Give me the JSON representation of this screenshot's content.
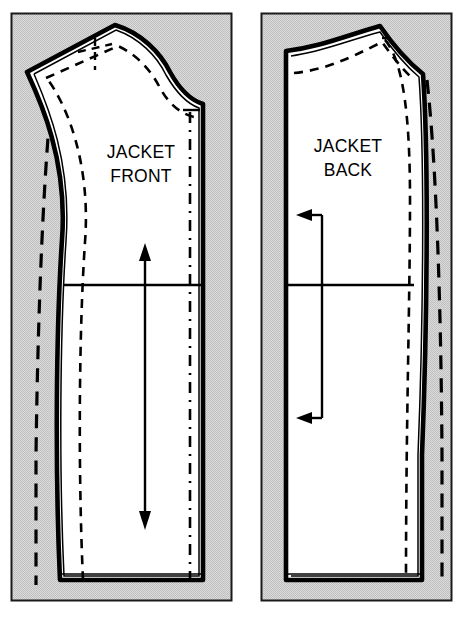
{
  "document": {
    "type": "sewing-pattern-diagram",
    "title": "Jacket pattern pieces",
    "background_color": "#ffffff"
  },
  "colors": {
    "fabric_fill": "#d9d9d9",
    "pattern_fill": "#ffffff",
    "ink": "#000000",
    "frame": "#1a1a1a"
  },
  "panels": [
    {
      "id": "front",
      "label_line1": "JACKET",
      "label_line2": "FRONT",
      "label_x": 141,
      "label_y": 158,
      "fabric_rect": {
        "x": 11,
        "y": 13,
        "width": 221,
        "height": 588
      },
      "grainline": {
        "style": "double-headed-arrow",
        "x": 145,
        "y_top": 250,
        "y_bottom": 524
      },
      "markings": [
        "cut-line",
        "seam-allowance-line",
        "stitch-dashed-line",
        "foldline-dash-dot",
        "hip-line",
        "hem-double-line"
      ]
    },
    {
      "id": "back",
      "label_line1": "JACKET",
      "label_line2": "BACK",
      "label_x": 348,
      "label_y": 152,
      "fabric_rect": {
        "x": 261,
        "y": 13,
        "width": 191,
        "height": 588
      },
      "grainline": {
        "style": "bracket-with-left-arrows",
        "x": 322,
        "y_top": 215,
        "y_bottom": 418,
        "arrow_tip_x": 297
      },
      "markings": [
        "cut-line",
        "seam-allowance-line",
        "stitch-dashed-line",
        "foldline-dash-dot",
        "hip-line",
        "hem-double-line"
      ]
    }
  ],
  "legend": {
    "cut_line": "solid heavy outline",
    "seam_allowance": "thin parallel line",
    "stitching_line": "short dashes",
    "fold_line": "long dashes"
  }
}
